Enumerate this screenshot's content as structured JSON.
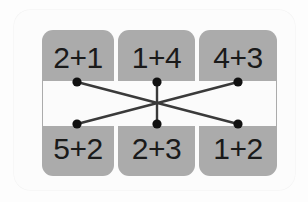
{
  "worksheet": {
    "title": "Addition matching worksheet",
    "colors": {
      "tile": "#ababab",
      "band": "#fbfbfb",
      "card": "#fcfcfc",
      "ink": "#1a1a1a",
      "connector": "#3a3a3a"
    },
    "top_row": [
      {
        "id": "top-0",
        "label": "2+1"
      },
      {
        "id": "top-1",
        "label": "1+4"
      },
      {
        "id": "top-2",
        "label": "4+3"
      }
    ],
    "bottom_row": [
      {
        "id": "bottom-0",
        "label": "5+2"
      },
      {
        "id": "bottom-1",
        "label": "2+3"
      },
      {
        "id": "bottom-2",
        "label": "1+2"
      }
    ],
    "nodes": [
      {
        "id": "node-top-0",
        "x": 77,
        "y": 82,
        "row": "top",
        "column": 0
      },
      {
        "id": "node-top-1",
        "x": 157,
        "y": 82,
        "row": "top",
        "column": 1
      },
      {
        "id": "node-top-2",
        "x": 238,
        "y": 82,
        "row": "top",
        "column": 2
      },
      {
        "id": "node-bottom-0",
        "x": 77,
        "y": 124,
        "row": "bottom",
        "column": 0
      },
      {
        "id": "node-bottom-1",
        "x": 157,
        "y": 124,
        "row": "bottom",
        "column": 1
      },
      {
        "id": "node-bottom-2",
        "x": 238,
        "y": 124,
        "row": "bottom",
        "column": 2
      }
    ],
    "connections": [
      {
        "id": "line-tl-br",
        "from": "node-top-0",
        "to": "node-bottom-2",
        "x1": 77,
        "y1": 82,
        "x2": 238,
        "y2": 124
      },
      {
        "id": "line-tr-bl",
        "from": "node-top-2",
        "to": "node-bottom-0",
        "x1": 238,
        "y1": 82,
        "x2": 77,
        "y2": 124
      },
      {
        "id": "line-tm-bm",
        "from": "node-top-1",
        "to": "node-bottom-1",
        "x1": 157,
        "y1": 82,
        "x2": 157,
        "y2": 124
      }
    ]
  }
}
